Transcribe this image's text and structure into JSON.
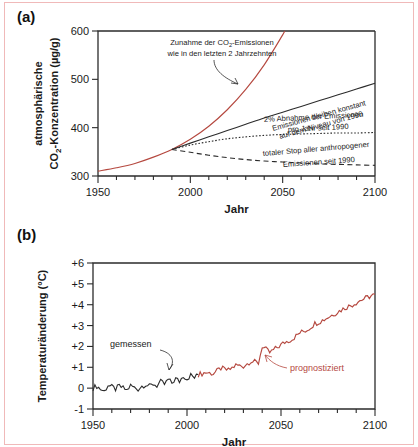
{
  "figure": {
    "panel_a_letter": "(a)",
    "panel_b_letter": "(b)",
    "accent_red": "#b5483f",
    "line_black": "#2b2b2b",
    "frame_pink": "#f0b9b9"
  },
  "chart_data": [
    {
      "id": "panel-a",
      "type": "line",
      "title": "",
      "xlabel": "Jahr",
      "ylabel": "atmosphärische CO₂-Konzentration (µg/g)",
      "ylabel_line1": "atmosphärische",
      "ylabel_line2": "CO",
      "ylabel_sub": "2",
      "ylabel_line2b": "-Konzentration (µg/g)",
      "xlim": [
        1950,
        2100
      ],
      "ylim": [
        300,
        600
      ],
      "xticks": [
        1950,
        2000,
        2050,
        2100
      ],
      "xtick_labels": [
        "1950",
        "2000",
        "2050",
        "2100"
      ],
      "yticks": [
        300,
        400,
        500,
        600
      ],
      "ytick_labels": [
        "300",
        "400",
        "500",
        "600"
      ],
      "xminor_step": 10,
      "grid": false,
      "legend": "annotations",
      "series": [
        {
          "name": "Zunahme der CO₂-Emissionen wie in den letzten 2 Jahrzehnten",
          "style": "solid-red",
          "color": "#b5483f",
          "x": [
            1950,
            1960,
            1970,
            1980,
            1990,
            2000,
            2010,
            2020,
            2030,
            2040,
            2050,
            2055,
            2060
          ],
          "y": [
            310,
            317,
            326,
            339,
            355,
            376,
            403,
            437,
            479,
            530,
            592,
            628,
            666
          ]
        },
        {
          "name": "Emissionen bleiben konstant auf dem Niveau von 1990",
          "style": "solid-black",
          "color": "#2b2b2b",
          "x": [
            1990,
            2000,
            2010,
            2020,
            2030,
            2040,
            2050,
            2060,
            2070,
            2080,
            2090,
            2100
          ],
          "y": [
            355,
            368,
            381,
            394,
            407,
            420,
            432,
            444,
            456,
            468,
            480,
            492
          ]
        },
        {
          "name": "2% Abnahme der Emissionen pro Jahr seit 1990",
          "style": "dotted-black",
          "color": "#2b2b2b",
          "x": [
            1990,
            2000,
            2010,
            2020,
            2030,
            2040,
            2050,
            2060,
            2070,
            2080,
            2090,
            2100
          ],
          "y": [
            355,
            364,
            371,
            377,
            381,
            384,
            386,
            387,
            388,
            389,
            389,
            390
          ]
        },
        {
          "name": "totaler Stop aller anthropogener Emissionen seit 1990",
          "style": "dashed-black",
          "color": "#2b2b2b",
          "x": [
            1990,
            2000,
            2010,
            2020,
            2030,
            2040,
            2050,
            2060,
            2070,
            2080,
            2090,
            2100
          ],
          "y": [
            355,
            349,
            343,
            338,
            334,
            331,
            329,
            327,
            325,
            324,
            323,
            322
          ]
        }
      ],
      "annotations": [
        {
          "id": "annot-zunahme",
          "lines": [
            "Zunahme der CO",
            "-Emissionen",
            "wie in den letzten 2 Jahrzehnten"
          ],
          "text_line1": "Zunahme der CO₂-Emissionen",
          "text_line2": "wie in den letzten 2 Jahrzehnten",
          "color": "#222222",
          "has_arrow": true
        },
        {
          "id": "annot-konstant",
          "text_line1": "Emissionen bleiben konstant",
          "text_line2": "auf dem Niveau von 1990",
          "color": "#222222",
          "rotated": true
        },
        {
          "id": "annot-abnahme",
          "text_line1": "2% Abnahme der Emissionen",
          "text_line2": "pro Jahr seit 1990",
          "color": "#222222",
          "rotated": false
        },
        {
          "id": "annot-stop",
          "text_line1": "totaler Stop aller anthropogener",
          "text_line2": "Emissionen seit 1990",
          "color": "#222222",
          "rotated": true
        }
      ]
    },
    {
      "id": "panel-b",
      "type": "line",
      "title": "",
      "xlabel": "Jahr",
      "ylabel": "Temperaturänderung (°C)",
      "xlim": [
        1950,
        2100
      ],
      "ylim": [
        -1,
        6
      ],
      "xticks": [
        1950,
        2000,
        2050,
        2100
      ],
      "xtick_labels": [
        "1950",
        "2000",
        "2050",
        "2100"
      ],
      "yticks": [
        -1,
        0,
        1,
        2,
        3,
        4,
        5,
        6
      ],
      "ytick_labels": [
        "-1",
        "0",
        "+1",
        "+2",
        "+3",
        "+4",
        "+5",
        "+6"
      ],
      "xminor_step": 10,
      "grid": false,
      "legend": "annotations",
      "series": [
        {
          "name": "gemessen",
          "style": "solid-black",
          "color": "#2b2b2b",
          "x": [
            1950,
            1952,
            1954,
            1956,
            1958,
            1960,
            1962,
            1964,
            1966,
            1968,
            1970,
            1972,
            1974,
            1976,
            1978,
            1980,
            1982,
            1984,
            1986,
            1988,
            1990,
            1992,
            1994,
            1996,
            1998,
            2000,
            2002,
            2004,
            2006
          ],
          "y": [
            0.0,
            0.1,
            -0.05,
            -0.15,
            0.15,
            0.05,
            -0.05,
            0.1,
            0.0,
            -0.1,
            0.12,
            0.02,
            -0.05,
            0.1,
            0.18,
            0.08,
            0.2,
            0.12,
            0.3,
            0.18,
            0.4,
            0.25,
            0.45,
            0.32,
            0.6,
            0.45,
            0.62,
            0.5,
            0.65
          ]
        },
        {
          "name": "prognostiziert",
          "style": "solid-red",
          "color": "#b5483f",
          "x": [
            2006,
            2010,
            2014,
            2018,
            2022,
            2026,
            2030,
            2034,
            2038,
            2040,
            2044,
            2048,
            2052,
            2056,
            2060,
            2064,
            2068,
            2072,
            2076,
            2080,
            2084,
            2088,
            2092,
            2096,
            2100
          ],
          "y": [
            0.65,
            0.75,
            0.7,
            0.95,
            0.85,
            1.1,
            1.05,
            1.3,
            1.2,
            2.0,
            1.7,
            1.95,
            2.2,
            2.35,
            2.65,
            2.8,
            3.1,
            3.25,
            3.45,
            3.65,
            3.85,
            4.0,
            4.2,
            4.35,
            4.5
          ]
        }
      ],
      "annotations": [
        {
          "id": "annot-gemessen",
          "text": "gemessen",
          "color": "#1a1a1a",
          "has_arrow": true
        },
        {
          "id": "annot-prognostiziert",
          "text": "prognostiziert",
          "color": "#b5483f",
          "has_arrow": true
        }
      ]
    }
  ]
}
